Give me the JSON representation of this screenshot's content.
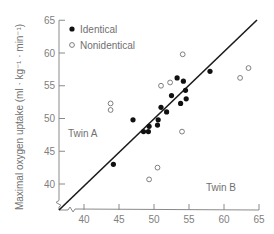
{
  "chart_data": {
    "type": "scatter",
    "title": "",
    "xlabel": "",
    "ylabel": "Maximal oxygen uptake (ml · kg⁻¹ · min⁻¹)",
    "xlim": [
      37,
      65
    ],
    "ylim": [
      36,
      65
    ],
    "x_ticks": [
      40,
      45,
      50,
      55,
      60,
      65
    ],
    "y_ticks": [
      40,
      45,
      50,
      55,
      60,
      65
    ],
    "grid": false,
    "legend_position": "upper-left",
    "annotations": [
      {
        "text": "Twin A",
        "x": 39.5,
        "y": 48
      },
      {
        "text": "Twin B",
        "x": 58.5,
        "y": 38.5
      }
    ],
    "identity_line": {
      "from": [
        37,
        36
      ],
      "to": [
        65,
        64
      ]
    },
    "series": [
      {
        "name": "Identical",
        "marker": "filled-circle",
        "points": [
          [
            44.2,
            43.0
          ],
          [
            47.0,
            49.8
          ],
          [
            48.5,
            48.0
          ],
          [
            49.2,
            48.0
          ],
          [
            49.3,
            48.8
          ],
          [
            50.5,
            49.0
          ],
          [
            50.6,
            49.8
          ],
          [
            51.0,
            51.7
          ],
          [
            51.8,
            51.0
          ],
          [
            52.5,
            53.5
          ],
          [
            53.3,
            56.2
          ],
          [
            53.8,
            52.3
          ],
          [
            54.2,
            55.7
          ],
          [
            54.5,
            54.3
          ],
          [
            54.6,
            53.0
          ],
          [
            58.0,
            57.2
          ]
        ]
      },
      {
        "name": "Nonidentical",
        "marker": "open-circle",
        "points": [
          [
            43.8,
            52.3
          ],
          [
            43.8,
            51.3
          ],
          [
            49.3,
            40.7
          ],
          [
            50.5,
            42.5
          ],
          [
            51.0,
            55.0
          ],
          [
            52.3,
            55.5
          ],
          [
            54.0,
            48.0
          ],
          [
            54.1,
            59.8
          ],
          [
            62.3,
            56.2
          ],
          [
            63.5,
            57.7
          ]
        ]
      }
    ]
  },
  "legend": {
    "identical_label": "Identical",
    "nonidentical_label": "Nonidentical"
  },
  "labels": {
    "twin_a": "Twin A",
    "twin_b": "Twin B",
    "y_axis_title": "Maximal oxygen uptake (ml · kg⁻¹ · min⁻¹)"
  },
  "colors": {
    "axis": "#8a8a8a",
    "line": "#1a1a1a",
    "filled": "#111111",
    "open_stroke": "#707070"
  }
}
